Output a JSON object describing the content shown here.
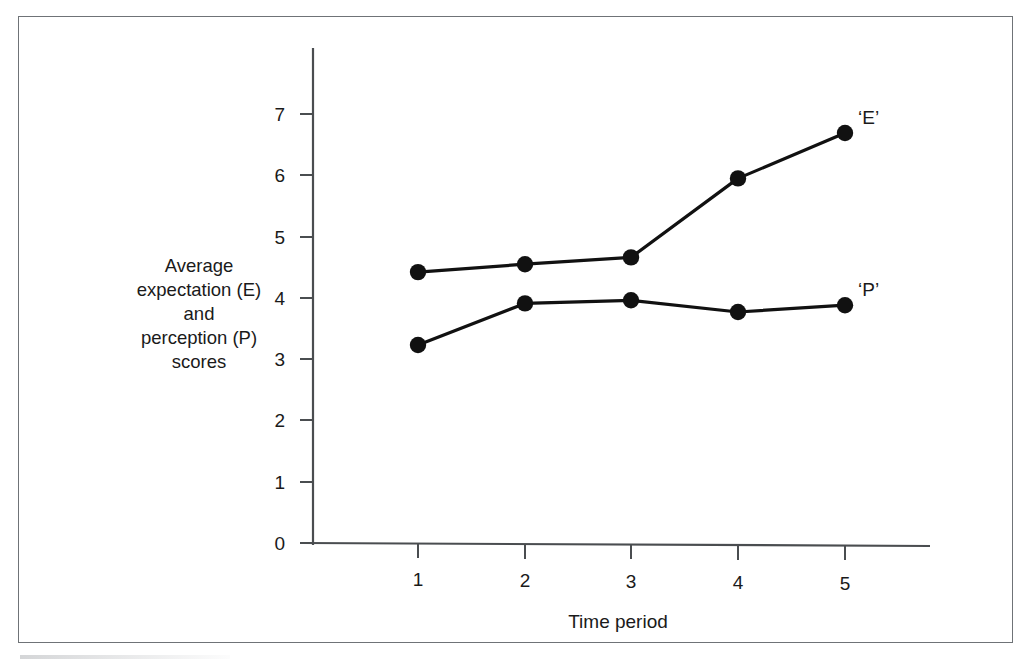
{
  "figure": {
    "frame_color": "#6f7377",
    "background": "#ffffff",
    "ink_color": "#1a1a1a"
  },
  "chart_data": {
    "type": "line",
    "title": "",
    "subtitle": "",
    "xlabel": "Time period",
    "ylabel": "Average expectation (E) and perception (P) scores",
    "ylabel_lines": [
      "Average",
      "expectation (E)",
      "and",
      "perception (P)",
      "scores"
    ],
    "x": [
      1,
      2,
      3,
      4,
      5
    ],
    "categories": [
      "1",
      "2",
      "3",
      "4",
      "5"
    ],
    "xtick_labels": [
      "1",
      "2",
      "3",
      "4",
      "5"
    ],
    "ytick_labels": [
      "0",
      "1",
      "2",
      "3",
      "4",
      "5",
      "6",
      "7"
    ],
    "yticks": [
      0,
      1,
      2,
      3,
      4,
      5,
      6,
      7
    ],
    "xlim": [
      0.6,
      5.55
    ],
    "ylim": [
      0,
      7.8
    ],
    "grid": false,
    "legend_position": "inline-right",
    "marker": "filled-circle",
    "series": [
      {
        "name": "'E'",
        "label": "‘E’",
        "values": [
          4.42,
          4.55,
          4.66,
          5.95,
          6.69
        ],
        "color": "#111111"
      },
      {
        "name": "'P'",
        "label": "‘P’",
        "values": [
          3.23,
          3.91,
          3.96,
          3.77,
          3.88
        ],
        "color": "#111111"
      }
    ]
  }
}
